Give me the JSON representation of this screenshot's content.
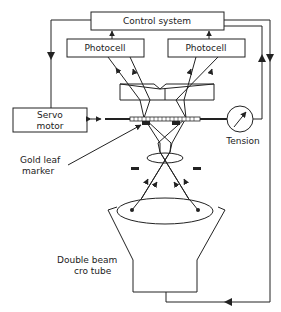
{
  "diagram": {
    "nodes": {
      "control_system": {
        "label": "Control system"
      },
      "photocell_left": {
        "label": "Photocell"
      },
      "photocell_right": {
        "label": "Photocell"
      },
      "servo_motor": {
        "line1": "Servo",
        "line2": "motor"
      },
      "tension": {
        "label": "Tension"
      },
      "gold_leaf_marker": {
        "line1": "Gold leaf",
        "line2": "marker"
      },
      "cro_tube": {
        "line1": "Double beam",
        "line2": "cro tube"
      }
    },
    "edges": [
      {
        "from": "control_system",
        "to": "servo_motor",
        "arrow": "down"
      },
      {
        "from": "photocell_left",
        "to": "control_system",
        "arrow": "up"
      },
      {
        "from": "photocell_right",
        "to": "control_system",
        "arrow": "up"
      },
      {
        "from": "tension",
        "to": "control_system",
        "arrow": "up"
      },
      {
        "from": "control_system",
        "to": "cro_tube",
        "arrow": "down"
      },
      {
        "from": "servo_motor",
        "to": "rod",
        "arrow": "bidirectional"
      }
    ],
    "colors": {
      "line": "#222222",
      "background": "#ffffff"
    }
  }
}
